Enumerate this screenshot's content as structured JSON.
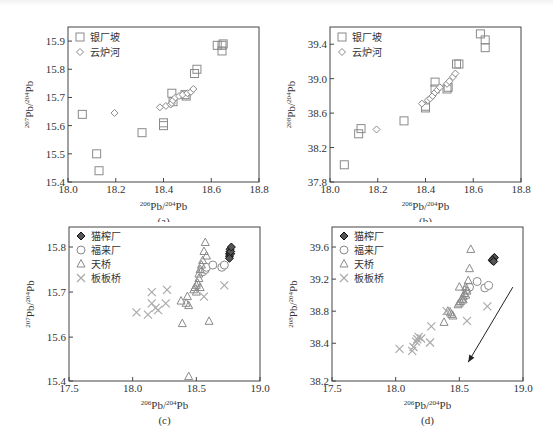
{
  "figure": {
    "panels": [
      "(a)",
      "(b)",
      "(c)",
      "(d)"
    ]
  },
  "chart_data": [
    {
      "id": "a",
      "type": "scatter",
      "caption": "(a)",
      "xlabel": "206Pb/204Pb",
      "ylabel": "207Pb/204Pb",
      "xlim": [
        18.0,
        18.8
      ],
      "ylim": [
        15.4,
        15.95
      ],
      "xticks": [
        18.0,
        18.2,
        18.4,
        18.6,
        18.8
      ],
      "yticks": [
        15.4,
        15.5,
        15.6,
        15.7,
        15.8,
        15.9
      ],
      "xtick_labels": [
        "18.0",
        "18.2",
        "18.4",
        "18.6",
        "18.8"
      ],
      "ytick_labels": [
        "15.4",
        "15.5",
        "15.6",
        "15.7",
        "15.8",
        "15.9"
      ],
      "legend": {
        "position": "upper left",
        "entries": [
          {
            "label": "银厂坡",
            "marker": "square"
          },
          {
            "label": "云炉河",
            "marker": "diamond"
          }
        ]
      },
      "series": [
        {
          "name": "银厂坡",
          "marker": "square",
          "points": [
            [
              18.06,
              15.64
            ],
            [
              18.12,
              15.5
            ],
            [
              18.13,
              15.44
            ],
            [
              18.31,
              15.575
            ],
            [
              18.4,
              15.6
            ],
            [
              18.4,
              15.61
            ],
            [
              18.435,
              15.715
            ],
            [
              18.44,
              15.685
            ],
            [
              18.49,
              15.71
            ],
            [
              18.495,
              15.705
            ],
            [
              18.53,
              15.785
            ],
            [
              18.54,
              15.8
            ],
            [
              18.625,
              15.885
            ],
            [
              18.645,
              15.885
            ],
            [
              18.645,
              15.865
            ],
            [
              18.65,
              15.89
            ]
          ]
        },
        {
          "name": "云炉河",
          "marker": "diamond",
          "points": [
            [
              18.195,
              15.645
            ],
            [
              18.385,
              15.665
            ],
            [
              18.41,
              15.67
            ],
            [
              18.43,
              15.675
            ],
            [
              18.435,
              15.68
            ],
            [
              18.44,
              15.69
            ],
            [
              18.45,
              15.7
            ],
            [
              18.465,
              15.705
            ],
            [
              18.48,
              15.71
            ],
            [
              18.5,
              15.715
            ],
            [
              18.515,
              15.72
            ],
            [
              18.525,
              15.73
            ]
          ]
        }
      ]
    },
    {
      "id": "b",
      "type": "scatter",
      "caption": "(b)",
      "xlabel": "206Pb/204Pb",
      "ylabel": "208Pb/204Pb",
      "xlim": [
        18.0,
        18.8
      ],
      "ylim": [
        37.8,
        39.6
      ],
      "xticks": [
        18.0,
        18.2,
        18.4,
        18.6,
        18.8
      ],
      "yticks": [
        37.8,
        38.2,
        38.6,
        39.0,
        39.4
      ],
      "xtick_labels": [
        "18.0",
        "18.2",
        "18.4",
        "18.6",
        "18.8"
      ],
      "ytick_labels": [
        "37.8",
        "38.2",
        "38.6",
        "39.0",
        "39.4"
      ],
      "legend": {
        "position": "upper left",
        "entries": [
          {
            "label": "银厂坡",
            "marker": "square"
          },
          {
            "label": "云炉河",
            "marker": "diamond"
          }
        ]
      },
      "series": [
        {
          "name": "银厂坡",
          "marker": "square",
          "points": [
            [
              18.06,
              38.0
            ],
            [
              18.12,
              38.36
            ],
            [
              18.13,
              38.42
            ],
            [
              18.31,
              38.51
            ],
            [
              18.4,
              38.66
            ],
            [
              18.4,
              38.68
            ],
            [
              18.44,
              38.96
            ],
            [
              18.44,
              38.88
            ],
            [
              18.49,
              38.88
            ],
            [
              18.495,
              38.9
            ],
            [
              18.53,
              39.17
            ],
            [
              18.54,
              39.17
            ],
            [
              18.63,
              39.52
            ],
            [
              18.65,
              39.45
            ],
            [
              18.65,
              39.36
            ]
          ]
        },
        {
          "name": "云炉河",
          "marker": "diamond",
          "points": [
            [
              18.195,
              38.41
            ],
            [
              18.385,
              38.71
            ],
            [
              18.41,
              38.75
            ],
            [
              18.42,
              38.77
            ],
            [
              18.43,
              38.8
            ],
            [
              18.44,
              38.84
            ],
            [
              18.45,
              38.87
            ],
            [
              18.46,
              38.9
            ],
            [
              18.49,
              38.94
            ],
            [
              18.5,
              38.97
            ],
            [
              18.515,
              39.02
            ],
            [
              18.525,
              39.06
            ]
          ]
        }
      ]
    },
    {
      "id": "c",
      "type": "scatter",
      "caption": "(c)",
      "xlabel": "206Pb/204Pb",
      "ylabel": "207Pb/204Pb",
      "xlim": [
        17.5,
        19.0
      ],
      "ylim": [
        15.4,
        15.85
      ],
      "axis_break": "y axis compressed between 15.4 and 15.6",
      "xticks": [
        17.5,
        18.0,
        18.5,
        19.0
      ],
      "yticks": [
        15.4,
        15.6,
        15.7,
        15.8
      ],
      "xtick_labels": [
        "17.5",
        "18.0",
        "18.5",
        "19.0"
      ],
      "ytick_labels": [
        "15.4",
        "15.6",
        "15.7",
        "15.8"
      ],
      "legend": {
        "position": "upper left",
        "entries": [
          {
            "label": "猫榨厂",
            "marker": "filled-diamond"
          },
          {
            "label": "福来厂",
            "marker": "circle"
          },
          {
            "label": "天桥",
            "marker": "triangle"
          },
          {
            "label": "板板桥",
            "marker": "cross"
          }
        ]
      },
      "series": [
        {
          "name": "猫榨厂",
          "marker": "filled-diamond",
          "points": [
            [
              18.76,
              15.78
            ],
            [
              18.76,
              15.785
            ],
            [
              18.765,
              15.79
            ],
            [
              18.765,
              15.795
            ],
            [
              18.77,
              15.785
            ],
            [
              18.77,
              15.79
            ],
            [
              18.775,
              15.8
            ],
            [
              18.76,
              15.775
            ]
          ]
        },
        {
          "name": "福来厂",
          "marker": "circle",
          "points": [
            [
              18.55,
              15.745
            ],
            [
              18.57,
              15.75
            ],
            [
              18.58,
              15.755
            ],
            [
              18.63,
              15.76
            ],
            [
              18.7,
              15.755
            ],
            [
              18.72,
              15.76
            ]
          ]
        },
        {
          "name": "天桥",
          "marker": "triangle",
          "points": [
            [
              18.57,
              15.81
            ],
            [
              18.56,
              15.79
            ],
            [
              18.58,
              15.78
            ],
            [
              18.55,
              15.77
            ],
            [
              18.54,
              15.76
            ],
            [
              18.53,
              15.75
            ],
            [
              18.52,
              15.74
            ],
            [
              18.52,
              15.73
            ],
            [
              18.51,
              15.72
            ],
            [
              18.5,
              15.715
            ],
            [
              18.49,
              15.71
            ],
            [
              18.48,
              15.705
            ],
            [
              18.5,
              15.7
            ],
            [
              18.53,
              15.71
            ],
            [
              18.38,
              15.68
            ],
            [
              18.42,
              15.675
            ],
            [
              18.43,
              15.69
            ],
            [
              18.44,
              15.67
            ],
            [
              18.39,
              15.63
            ],
            [
              18.6,
              15.635
            ],
            [
              18.44,
              15.42
            ]
          ]
        },
        {
          "name": "板板桥",
          "marker": "cross",
          "points": [
            [
              18.03,
              15.655
            ],
            [
              18.12,
              15.65
            ],
            [
              18.15,
              15.7
            ],
            [
              18.15,
              15.675
            ],
            [
              18.18,
              15.665
            ],
            [
              18.2,
              15.66
            ],
            [
              18.26,
              15.675
            ],
            [
              18.27,
              15.705
            ],
            [
              18.56,
              15.69
            ],
            [
              18.72,
              15.715
            ]
          ]
        }
      ]
    },
    {
      "id": "d",
      "type": "scatter",
      "caption": "(d)",
      "xlabel": "206Pb/204Pb",
      "ylabel": "208Pb/204Pb",
      "xlim": [
        17.5,
        19.0
      ],
      "ylim": [
        38.2,
        39.8
      ],
      "axis_break": "y axis compressed between 38.2 and 38.4",
      "xticks": [
        17.5,
        18.0,
        18.5,
        19.0
      ],
      "yticks": [
        38.2,
        38.4,
        38.8,
        39.2,
        39.6
      ],
      "xtick_labels": [
        "17.5",
        "18.0",
        "18.5",
        "19.0"
      ],
      "ytick_labels": [
        "38.2",
        "38.4",
        "38.8",
        "39.2",
        "39.6"
      ],
      "legend": {
        "position": "upper left",
        "entries": [
          {
            "label": "猫榨厂",
            "marker": "filled-diamond"
          },
          {
            "label": "福来厂",
            "marker": "circle"
          },
          {
            "label": "天桥",
            "marker": "triangle"
          },
          {
            "label": "板板桥",
            "marker": "cross"
          }
        ]
      },
      "annotations": [
        {
          "type": "arrow",
          "from": [
            18.92,
            39.1
          ],
          "to": [
            18.57,
            38.3
          ]
        }
      ],
      "series": [
        {
          "name": "猫榨厂",
          "marker": "filled-diamond",
          "points": [
            [
              18.76,
              39.43
            ],
            [
              18.765,
              39.45
            ],
            [
              18.77,
              39.46
            ],
            [
              18.775,
              39.47
            ],
            [
              18.76,
              39.44
            ],
            [
              18.77,
              39.42
            ]
          ]
        },
        {
          "name": "福来厂",
          "marker": "circle",
          "points": [
            [
              18.56,
              39.07
            ],
            [
              18.58,
              39.1
            ],
            [
              18.64,
              39.17
            ],
            [
              18.7,
              39.09
            ],
            [
              18.73,
              39.12
            ]
          ]
        },
        {
          "name": "天桥",
          "marker": "triangle",
          "points": [
            [
              18.59,
              39.57
            ],
            [
              18.58,
              39.33
            ],
            [
              18.57,
              39.18
            ],
            [
              18.55,
              39.1
            ],
            [
              18.56,
              39.05
            ],
            [
              18.54,
              39.02
            ],
            [
              18.53,
              38.98
            ],
            [
              18.52,
              38.95
            ],
            [
              18.51,
              38.92
            ],
            [
              18.5,
              38.9
            ],
            [
              18.49,
              38.88
            ],
            [
              18.53,
              38.94
            ],
            [
              18.55,
              39.0
            ],
            [
              18.41,
              38.8
            ],
            [
              18.43,
              38.78
            ],
            [
              18.44,
              38.76
            ],
            [
              18.45,
              38.74
            ],
            [
              18.38,
              38.66
            ],
            [
              18.5,
              39.1
            ]
          ]
        },
        {
          "name": "板板桥",
          "marker": "cross",
          "points": [
            [
              18.03,
              38.37
            ],
            [
              18.13,
              38.36
            ],
            [
              18.14,
              38.38
            ],
            [
              18.16,
              38.42
            ],
            [
              18.17,
              38.45
            ],
            [
              18.18,
              38.48
            ],
            [
              18.2,
              38.46
            ],
            [
              18.27,
              38.41
            ],
            [
              18.28,
              38.61
            ],
            [
              18.4,
              38.8
            ],
            [
              18.56,
              38.68
            ],
            [
              18.72,
              38.86
            ]
          ]
        }
      ]
    }
  ]
}
